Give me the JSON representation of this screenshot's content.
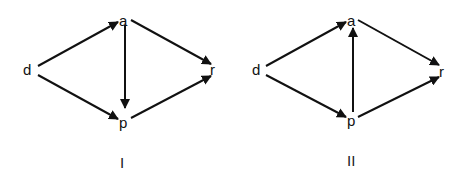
{
  "diagrams": [
    {
      "caption": "I",
      "nodes": {
        "d": "d",
        "a": "a",
        "p": "p",
        "r": "r"
      },
      "edges": [
        [
          "d",
          "a"
        ],
        [
          "d",
          "p"
        ],
        [
          "a",
          "r"
        ],
        [
          "p",
          "r"
        ],
        [
          "a",
          "p"
        ]
      ]
    },
    {
      "caption": "II",
      "nodes": {
        "d": "d",
        "a": "a",
        "p": "p",
        "r": "r"
      },
      "edges": [
        [
          "d",
          "a"
        ],
        [
          "d",
          "p"
        ],
        [
          "a",
          "r"
        ],
        [
          "p",
          "r"
        ],
        [
          "p",
          "a"
        ]
      ]
    }
  ]
}
